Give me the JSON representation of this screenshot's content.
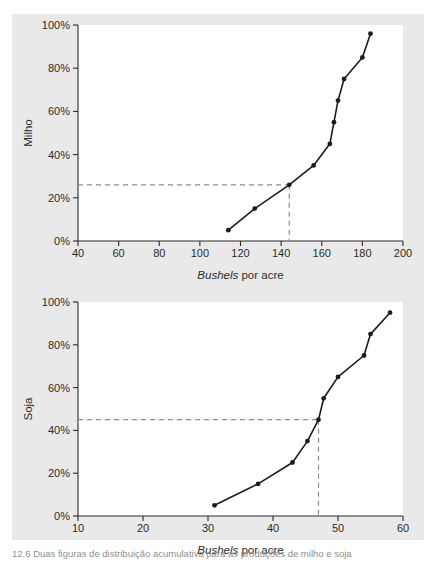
{
  "page": {
    "caption": "12.6  Duas figuras de distribuição acumulativa para as produções de milho e soja",
    "background_color": "#ffffff",
    "scan_band_color": "#e9e9e9",
    "ink_color": "#1c1c1c",
    "dash_color": "#8d8d8d"
  },
  "chart_data": [
    {
      "type": "line",
      "id": "milho",
      "title": "",
      "xlabel_italic": "Bushels",
      "xlabel_rest": " por acre",
      "xlabel": "Bushels por acre",
      "ylabel": "Milho",
      "xlim": [
        40,
        200
      ],
      "ylim": [
        0,
        100
      ],
      "xticks": [
        40,
        60,
        80,
        100,
        120,
        140,
        160,
        180,
        200
      ],
      "xticklabels": [
        "40",
        "60",
        "80",
        "100",
        "120",
        "140",
        "160",
        "180",
        "200"
      ],
      "yticks": [
        0,
        20,
        40,
        60,
        80,
        100
      ],
      "yticklabels": [
        "0%",
        "20%",
        "40%",
        "60%",
        "80%",
        "100%"
      ],
      "grid": false,
      "legend": "none",
      "x": [
        114,
        127,
        144,
        156,
        164,
        166,
        168,
        171,
        180,
        184
      ],
      "y": [
        5,
        15,
        26,
        35,
        45,
        55,
        65,
        75,
        85,
        96
      ],
      "reference_lines": {
        "horizontal_y": 26,
        "vertical_x": 144
      }
    },
    {
      "type": "line",
      "id": "soja",
      "title": "",
      "xlabel_italic": "Bushels",
      "xlabel_rest": " por acre",
      "xlabel": "Bushels por acre",
      "ylabel": "Soja",
      "xlim": [
        10,
        60
      ],
      "ylim": [
        0,
        100
      ],
      "xticks": [
        10,
        20,
        30,
        40,
        50,
        60
      ],
      "xticklabels": [
        "10",
        "20",
        "30",
        "40",
        "50",
        "60"
      ],
      "yticks": [
        0,
        20,
        40,
        60,
        80,
        100
      ],
      "yticklabels": [
        "0%",
        "20%",
        "40%",
        "60%",
        "80%",
        "100%"
      ],
      "grid": false,
      "legend": "none",
      "x": [
        31.0,
        37.7,
        43.0,
        45.3,
        47.0,
        47.8,
        50.0,
        54.0,
        55.0,
        58.0
      ],
      "y": [
        5,
        15,
        25,
        35,
        45,
        55,
        65,
        75,
        85,
        95
      ],
      "reference_lines": {
        "horizontal_y": 45,
        "vertical_x": 47.0
      }
    }
  ]
}
